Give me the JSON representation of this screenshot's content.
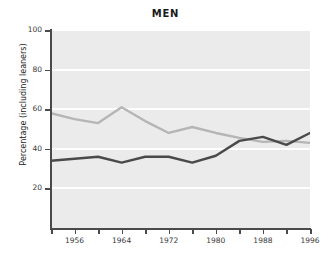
{
  "chart_data": {
    "type": "line",
    "title": "MEN",
    "xlabel": "",
    "ylabel": "Percentage (including leaners)",
    "xlim": [
      1952,
      1996
    ],
    "ylim": [
      0,
      100
    ],
    "grid": true,
    "legend": "none",
    "ytick_labels": [
      "100",
      "80",
      "60",
      "40",
      "20"
    ],
    "ytick_values": [
      100,
      80,
      60,
      40,
      20
    ],
    "xtick_labels": [
      "",
      "1956",
      "",
      "1964",
      "",
      "1972",
      "",
      "1980",
      "",
      "1988",
      "",
      "1996"
    ],
    "xtick_values": [
      1952,
      1956,
      1960,
      1964,
      1968,
      1972,
      1976,
      1980,
      1984,
      1988,
      1992,
      1996
    ],
    "x": [
      1952,
      1956,
      1960,
      1964,
      1968,
      1972,
      1976,
      1980,
      1984,
      1988,
      1992,
      1996
    ],
    "series": [
      {
        "name": "light-gray-line",
        "color": "#b5b5b5",
        "values": [
          58,
          55,
          53,
          61,
          54,
          48,
          51,
          48,
          45.5,
          43.5,
          44,
          43
        ]
      },
      {
        "name": "dark-gray-line",
        "color": "#4a4a4a",
        "values": [
          34,
          35,
          36,
          33,
          36,
          36,
          33,
          36.5,
          44,
          46,
          42,
          48
        ]
      }
    ]
  },
  "colors": {
    "plot_background": "#ebebeb",
    "gridline": "#ffffff",
    "axis": "#4a4a4a",
    "title_text": "#1b1b1b",
    "tick_text": "#3a3a3a"
  }
}
